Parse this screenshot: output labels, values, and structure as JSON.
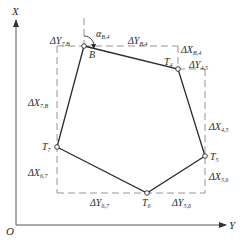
{
  "diagram": {
    "type": "traverse-polygon",
    "colors": {
      "line": "#2a2a2a",
      "dash": "#8a8a8a",
      "axis": "#555555",
      "background": "#ffffff"
    },
    "axes": {
      "origin_label": "O",
      "vertical_label": "X",
      "horizontal_label": "Y"
    },
    "points": [
      {
        "id": "B",
        "label": "B",
        "sub": ""
      },
      {
        "id": "T4",
        "label": "T",
        "sub": "4"
      },
      {
        "id": "T5",
        "label": "T",
        "sub": "5"
      },
      {
        "id": "T6",
        "label": "T",
        "sub": "6"
      },
      {
        "id": "T7",
        "label": "T",
        "sub": "7"
      }
    ],
    "angle": {
      "label": "α",
      "sub": "B,4"
    },
    "increments": {
      "dY_7B": {
        "main": "ΔY",
        "sub": "7,B"
      },
      "dX_7B": {
        "main": "ΔX",
        "sub": "7,B"
      },
      "dY_B4": {
        "main": "ΔY",
        "sub": "B,4"
      },
      "dX_B4": {
        "main": "ΔX",
        "sub": "B,4"
      },
      "dY_45": {
        "main": "ΔY",
        "sub": "4,5"
      },
      "dX_45": {
        "main": "ΔX",
        "sub": "4,5"
      },
      "dX_56": {
        "main": "ΔX",
        "sub": "5,6"
      },
      "dY_56": {
        "main": "ΔY",
        "sub": "5,6"
      },
      "dX_67": {
        "main": "ΔX",
        "sub": "6,7"
      },
      "dY_67": {
        "main": "ΔY",
        "sub": "6,7"
      }
    }
  }
}
